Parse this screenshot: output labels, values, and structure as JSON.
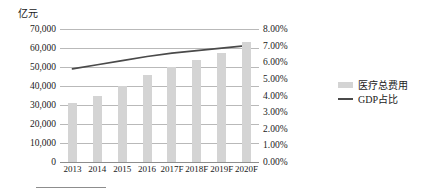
{
  "chart_data": {
    "type": "bar",
    "title": "",
    "subtitle": "",
    "xlabel": "",
    "ylabel": "亿元",
    "y_right_label": "",
    "grid": true,
    "legend_position": "right",
    "categories": [
      "2013",
      "2014",
      "2015",
      "2016",
      "2017F",
      "2018F",
      "2019F",
      "2020F"
    ],
    "ylim": [
      0,
      70000
    ],
    "y_ticks": [
      0,
      10000,
      20000,
      30000,
      40000,
      50000,
      60000,
      70000
    ],
    "y_tick_labels": [
      "0",
      "10,000",
      "20,000",
      "30,000",
      "40,000",
      "50,000",
      "60,000",
      "70,000"
    ],
    "y2lim": [
      0,
      8
    ],
    "y2_ticks": [
      0,
      1,
      2,
      3,
      4,
      5,
      6,
      7,
      8
    ],
    "y2_tick_labels": [
      "0.00%",
      "1.00%",
      "2.00%",
      "3.00%",
      "4.00%",
      "5.00%",
      "6.00%",
      "7.00%",
      "8.00%"
    ],
    "series": [
      {
        "name": "医疗总费用",
        "type": "bar",
        "axis": "left",
        "color": "#d4d4d4",
        "values": [
          31000,
          35000,
          40000,
          46000,
          50000,
          53500,
          57500,
          63000
        ]
      },
      {
        "name": "GDP占比",
        "type": "line",
        "axis": "right",
        "color": "#4a4a4a",
        "values": [
          5.6,
          5.85,
          6.1,
          6.35,
          6.55,
          6.7,
          6.85,
          7.0
        ]
      }
    ]
  },
  "axes": {
    "unit_caption": "亿元"
  },
  "legend": {
    "items": [
      {
        "label": "医疗总费用",
        "marker": "bar-swatch",
        "color": "#d4d4d4"
      },
      {
        "label": "GDP占比",
        "marker": "line-swatch",
        "color": "#4a4a4a"
      }
    ]
  }
}
